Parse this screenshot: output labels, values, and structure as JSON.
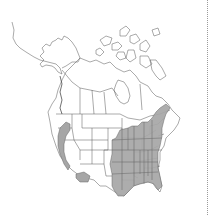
{
  "map": {
    "type": "range-map",
    "region": "North America",
    "colors": {
      "background": "#ffffff",
      "outline": "#555555",
      "range_fill": "#a6a6a6",
      "divider": "#9a9a9a"
    },
    "range_areas": [
      {
        "name": "pacific-coast-range",
        "description": "Coastal Washington, Oregon and California"
      },
      {
        "name": "southern-california-range",
        "description": "Southern California / Arizona border patch"
      },
      {
        "name": "eastern-range",
        "description": "Eastern United States from the Great Plains to the Atlantic coast, north into New England"
      }
    ]
  }
}
